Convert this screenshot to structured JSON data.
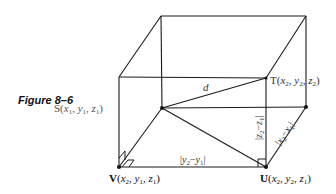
{
  "figure": {
    "caption": "Figure 8–6",
    "points": {
      "S": {
        "label": "S",
        "coords": "(x1, y1, z1)"
      },
      "T": {
        "label": "T",
        "coords": "(x2, y2, z2)"
      },
      "U": {
        "label": "U",
        "coords": "(x2, y2, z1)"
      },
      "V": {
        "label": "V",
        "coords": "(x2, y1, z1)"
      }
    },
    "segment_labels": {
      "distance": "d",
      "y_diff": "|y2 − y1|",
      "z_diff": "|z2 − z1|",
      "x_diff": "|x2 − x1|"
    },
    "colors": {
      "line": "#1a1a1a",
      "label_muted": "#555555"
    }
  }
}
